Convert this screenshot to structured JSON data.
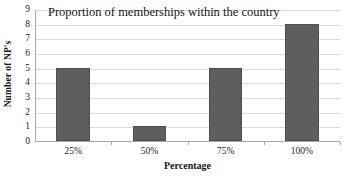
{
  "chart_data": {
    "type": "bar",
    "title": "Proportion of memberships within the country",
    "xlabel": "Percentage",
    "ylabel": "Number of NP's",
    "categories": [
      "25%",
      "50%",
      "75%",
      "100%"
    ],
    "values": [
      5,
      1,
      5,
      8
    ],
    "ylim": [
      0,
      9
    ],
    "ytick_labels": [
      "0",
      "1",
      "2",
      "3",
      "4",
      "5",
      "6",
      "7",
      "8",
      "9"
    ],
    "ytick_values": [
      0,
      1,
      2,
      3,
      4,
      5,
      6,
      7,
      8,
      9
    ],
    "grid": true,
    "grid_axis": "y",
    "legend": false,
    "legend_position": "none",
    "series": [
      {
        "name": "Number of NP's",
        "values": [
          5,
          1,
          5,
          8
        ]
      }
    ],
    "colors": {
      "bar_fill": "#5e5e5e",
      "bar_border": "#4f4f4f",
      "gridline": "#d9d9d9",
      "axis_line": "#a6a6a6",
      "plot_background": "#ffffff",
      "text": "#1a1a1a"
    }
  }
}
